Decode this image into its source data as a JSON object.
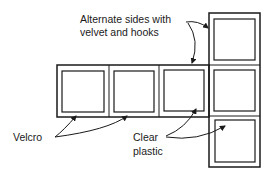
{
  "diagram": {
    "labels": {
      "alternate_line1": "Alternate sides with",
      "alternate_line2": "velvet and hooks",
      "velcro": "Velcro",
      "clear_line1": "Clear",
      "clear_line2": "plastic"
    },
    "layout": {
      "horizontal_panels": 3,
      "vertical_panels": 3,
      "description": "Cross-shaped net of square pockets with clear plastic windows joined by Velcro"
    },
    "colors": {
      "stroke": "#1a1a1a",
      "background": "#ffffff"
    }
  }
}
